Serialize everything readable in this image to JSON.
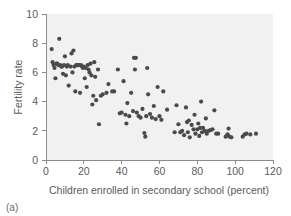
{
  "figure": {
    "caption": "(a)",
    "background_color": "#ffffff",
    "plot_background_color": "#f1f1f1",
    "point_color": "#4a4a4a",
    "axis_color": "#8a8a8a"
  },
  "chart_data": {
    "type": "scatter",
    "title": "",
    "xlabel": "Children enrolled in secondary school (percent)",
    "ylabel": "Fertility rate",
    "xlim": [
      0,
      120
    ],
    "ylim": [
      0,
      10
    ],
    "xticks": [
      0,
      20,
      40,
      60,
      80,
      100,
      120
    ],
    "yticks": [
      0,
      2,
      4,
      6,
      8,
      10
    ],
    "grid": false,
    "legend": null,
    "marker": "circle",
    "marker_size": 3,
    "points": [
      [
        3.0,
        7.6
      ],
      [
        3.5,
        6.7
      ],
      [
        4.0,
        6.5
      ],
      [
        4.5,
        6.3
      ],
      [
        5.0,
        5.6
      ],
      [
        5.5,
        6.6
      ],
      [
        6.0,
        6.6
      ],
      [
        6.5,
        6.5
      ],
      [
        7.0,
        8.3
      ],
      [
        7.5,
        6.5
      ],
      [
        8.0,
        6.4
      ],
      [
        8.5,
        6.4
      ],
      [
        9.0,
        5.9
      ],
      [
        9.5,
        6.5
      ],
      [
        10.0,
        7.1
      ],
      [
        10.5,
        5.8
      ],
      [
        11.0,
        6.4
      ],
      [
        11.5,
        6.5
      ],
      [
        12.0,
        5.1
      ],
      [
        13.0,
        6.4
      ],
      [
        13.5,
        7.3
      ],
      [
        14.0,
        6.0
      ],
      [
        14.5,
        7.5
      ],
      [
        15.0,
        6.4
      ],
      [
        15.5,
        4.7
      ],
      [
        16.0,
        6.5
      ],
      [
        16.5,
        6.5
      ],
      [
        17.0,
        6.5
      ],
      [
        17.5,
        6.5
      ],
      [
        18.0,
        4.6
      ],
      [
        18.5,
        6.5
      ],
      [
        19.0,
        6.4
      ],
      [
        19.5,
        6.3
      ],
      [
        20.0,
        6.4
      ],
      [
        20.5,
        5.6
      ],
      [
        21.0,
        6.3
      ],
      [
        21.5,
        5.0
      ],
      [
        22.0,
        6.5
      ],
      [
        22.5,
        6.2
      ],
      [
        23.0,
        6.0
      ],
      [
        23.5,
        6.6
      ],
      [
        24.0,
        5.8
      ],
      [
        24.5,
        3.8
      ],
      [
        25.0,
        4.4
      ],
      [
        25.5,
        6.7
      ],
      [
        26.0,
        5.7
      ],
      [
        26.5,
        4.1
      ],
      [
        27.5,
        6.2
      ],
      [
        28.0,
        2.45
      ],
      [
        29.0,
        4.4
      ],
      [
        30.0,
        4.5
      ],
      [
        32.0,
        4.6
      ],
      [
        33.0,
        5.2
      ],
      [
        35.0,
        4.7
      ],
      [
        36.0,
        4.7
      ],
      [
        38.0,
        6.2
      ],
      [
        39.0,
        3.2
      ],
      [
        40.0,
        3.25
      ],
      [
        41.0,
        5.4
      ],
      [
        42.0,
        3.1
      ],
      [
        42.5,
        2.5
      ],
      [
        43.0,
        3.9
      ],
      [
        44.0,
        3.0
      ],
      [
        45.0,
        4.6
      ],
      [
        46.0,
        3.35
      ],
      [
        46.5,
        7.0
      ],
      [
        47.5,
        7.0
      ],
      [
        47.0,
        6.2
      ],
      [
        48.0,
        3.25
      ],
      [
        49.0,
        3.0
      ],
      [
        50.0,
        2.9
      ],
      [
        51.0,
        3.5
      ],
      [
        52.0,
        1.85
      ],
      [
        52.5,
        1.6
      ],
      [
        53.0,
        3.0
      ],
      [
        53.5,
        6.3
      ],
      [
        54.0,
        4.5
      ],
      [
        55.0,
        3.15
      ],
      [
        56.0,
        2.9
      ],
      [
        57.0,
        3.7
      ],
      [
        58.0,
        2.8
      ],
      [
        59.0,
        5.0
      ],
      [
        60.0,
        3.0
      ],
      [
        61.0,
        2.75
      ],
      [
        62.0,
        4.7
      ],
      [
        64.0,
        3.45
      ],
      [
        68.0,
        1.9
      ],
      [
        69.0,
        3.75
      ],
      [
        70.0,
        2.45
      ],
      [
        71.0,
        1.9
      ],
      [
        72.0,
        2.0
      ],
      [
        73.0,
        1.7
      ],
      [
        74.0,
        3.6
      ],
      [
        74.5,
        2.6
      ],
      [
        75.0,
        1.9
      ],
      [
        75.5,
        2.7
      ],
      [
        76.0,
        1.55
      ],
      [
        77.0,
        2.4
      ],
      [
        78.0,
        2.1
      ],
      [
        78.5,
        3.1
      ],
      [
        79.0,
        1.8
      ],
      [
        80.0,
        2.1
      ],
      [
        80.5,
        2.5
      ],
      [
        81.0,
        1.65
      ],
      [
        81.5,
        2.2
      ],
      [
        82.0,
        4.0
      ],
      [
        82.5,
        1.9
      ],
      [
        83.0,
        2.2
      ],
      [
        84.0,
        2.0
      ],
      [
        84.5,
        2.85
      ],
      [
        85.0,
        1.8
      ],
      [
        86.0,
        2.0
      ],
      [
        87.0,
        2.05
      ],
      [
        88.0,
        2.1
      ],
      [
        89.0,
        3.4
      ],
      [
        90.0,
        1.8
      ],
      [
        91.0,
        1.8
      ],
      [
        95.0,
        1.6
      ],
      [
        96.0,
        1.75
      ],
      [
        96.5,
        2.15
      ],
      [
        97.0,
        1.6
      ],
      [
        98.0,
        1.55
      ],
      [
        104.0,
        1.6
      ],
      [
        105.0,
        1.75
      ],
      [
        106.0,
        1.8
      ],
      [
        108.0,
        1.75
      ],
      [
        111.0,
        1.8
      ]
    ]
  }
}
